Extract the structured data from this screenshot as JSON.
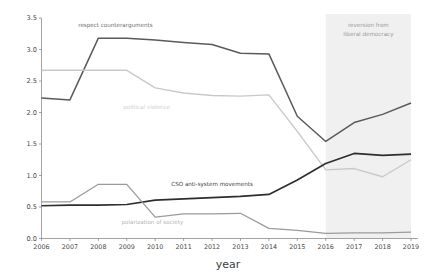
{
  "chart_data": {
    "type": "line",
    "title": "",
    "xlabel": "year",
    "ylabel": "",
    "xlim": [
      2006,
      2019
    ],
    "ylim": [
      0.0,
      3.5
    ],
    "grid": false,
    "legend_position": "inline-labels",
    "x": [
      2006,
      2007,
      2008,
      2009,
      2010,
      2011,
      2012,
      2013,
      2014,
      2015,
      2016,
      2017,
      2018,
      2019
    ],
    "xtick_labels": [
      "2006",
      "2007",
      "2008",
      "2009",
      "2010",
      "2011",
      "2012",
      "2013",
      "2014",
      "2015",
      "2016",
      "2017",
      "2018",
      "2019"
    ],
    "ytick_labels": [
      "0.0",
      "0.5",
      "1.0",
      "1.5",
      "2.0",
      "2.5",
      "3.0",
      "3.5"
    ],
    "ytick_values": [
      0.0,
      0.5,
      1.0,
      1.5,
      2.0,
      2.5,
      3.0,
      3.5
    ],
    "series": [
      {
        "name": "respect counterarguments",
        "color": "#5a5a5a",
        "width": 1.5,
        "label": "respect counterarguments",
        "label_x": 2008.6,
        "label_y": 3.36,
        "label_color": "#6e6e6e",
        "values": [
          2.23,
          2.2,
          3.18,
          3.18,
          3.15,
          3.11,
          3.08,
          2.94,
          2.93,
          1.94,
          1.54,
          1.84,
          1.97,
          2.15
        ]
      },
      {
        "name": "political violence",
        "color": "#c9c9c9",
        "width": 1.4,
        "label": "political violence",
        "label_x": 2009.7,
        "label_y": 2.06,
        "label_color": "#cfcfcf",
        "values": [
          2.67,
          2.67,
          2.67,
          2.67,
          2.39,
          2.31,
          2.27,
          2.26,
          2.28,
          1.7,
          1.09,
          1.11,
          0.98,
          1.25
        ]
      },
      {
        "name": "CSO anti-system movements",
        "color": "#2e2e2e",
        "width": 1.7,
        "label": "CSO anti-system movements",
        "label_x": 2012.0,
        "label_y": 0.83,
        "label_color": "#444444",
        "values": [
          0.52,
          0.53,
          0.53,
          0.54,
          0.61,
          0.63,
          0.65,
          0.67,
          0.7,
          0.93,
          1.19,
          1.35,
          1.32,
          1.34
        ]
      },
      {
        "name": "polarization of society",
        "color": "#9b9b9b",
        "width": 1.3,
        "label": "polarization of society",
        "label_x": 2009.9,
        "label_y": 0.23,
        "label_color": "#b4b4b4",
        "values": [
          0.58,
          0.58,
          0.86,
          0.86,
          0.34,
          0.39,
          0.39,
          0.4,
          0.16,
          0.13,
          0.08,
          0.09,
          0.09,
          0.1
        ]
      }
    ],
    "annotations": [
      {
        "name": "reversion-band",
        "type": "shaded-region",
        "x_start": 2016,
        "x_end": 2019,
        "color": "#f0f0f0",
        "text_line1": "reversion from",
        "text_line2": "liberal democracy",
        "text_x": 2017.5,
        "text_y1": 3.35,
        "text_y2": 3.21
      }
    ]
  },
  "axes": {
    "x_title": "year",
    "axis_color": "#8c8c8c"
  }
}
